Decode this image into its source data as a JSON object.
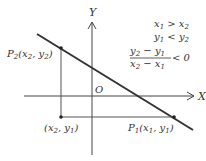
{
  "diagram": {
    "axes": {
      "x_label": "X",
      "y_label": "Y",
      "origin_label": "O"
    },
    "points": {
      "p2": {
        "label": "P",
        "sub": "2",
        "coords": "(x",
        "coords_sub1": "2",
        "coords_mid": ", y",
        "coords_sub2": "2",
        "coords_end": ")"
      },
      "corner": {
        "label": "(x",
        "sub1": "2",
        "mid": ", y",
        "sub2": "1",
        "end": ")"
      },
      "p1": {
        "label": "P",
        "sub": "1",
        "coords": "(x",
        "coords_sub1": "1",
        "coords_mid": ", y",
        "coords_sub2": "1",
        "coords_end": ")"
      }
    },
    "conditions": {
      "line1": {
        "a": "x",
        "a_sub": "1",
        "op": " > ",
        "b": "x",
        "b_sub": "2"
      },
      "line2": {
        "a": "y",
        "a_sub": "1",
        "op": " < ",
        "b": "y",
        "b_sub": "2"
      },
      "fraction": {
        "num_a": "y",
        "num_a_sub": "2",
        "num_op": " − ",
        "num_b": "y",
        "num_b_sub": "1",
        "den_a": "x",
        "den_a_sub": "2",
        "den_op": " − ",
        "den_b": "x",
        "den_b_sub": "1",
        "rel": "< 0"
      }
    },
    "colors": {
      "line": "#333333",
      "axis": "#444444",
      "guide": "#555555",
      "text": "#333333"
    }
  }
}
